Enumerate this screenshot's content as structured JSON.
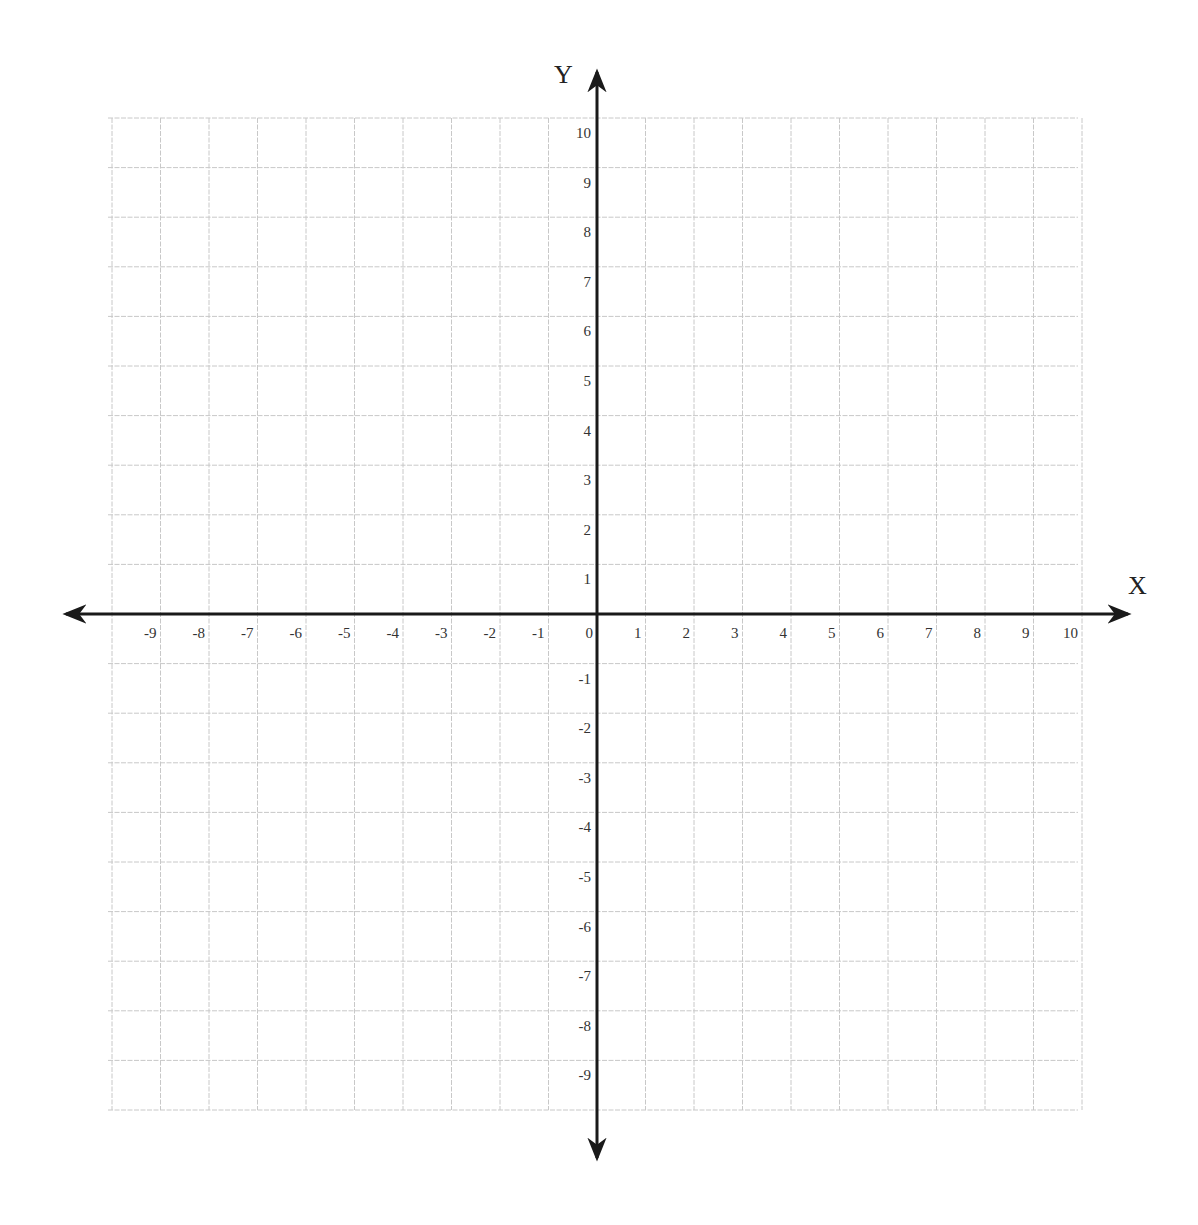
{
  "chart_data": {
    "type": "coordinate-plane",
    "title": "",
    "xlabel": "X",
    "ylabel": "Y",
    "xlim": [
      -10,
      10
    ],
    "ylim": [
      -10,
      10
    ],
    "grid": true,
    "x_ticks": [
      "-9",
      "-8",
      "-7",
      "-6",
      "-5",
      "-4",
      "-3",
      "-2",
      "-1",
      "0",
      "1",
      "2",
      "3",
      "4",
      "5",
      "6",
      "7",
      "8",
      "9",
      "10"
    ],
    "y_ticks": [
      "10",
      "9",
      "8",
      "7",
      "6",
      "5",
      "4",
      "3",
      "2",
      "1",
      "-1",
      "-2",
      "-3",
      "-4",
      "-5",
      "-6",
      "-7",
      "-8",
      "-9"
    ],
    "series": [],
    "colors": {
      "grid": "#c8c8c8",
      "axis": "#1a1a1a",
      "text": "#333333"
    }
  }
}
